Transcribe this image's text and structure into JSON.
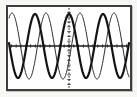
{
  "screen": {
    "background_color": "#f7f7f4",
    "frame_border_color": "#3e3e3e",
    "frame_fill_color": "#ffffff"
  },
  "chart_data": {
    "type": "line",
    "title": "",
    "xlabel": "",
    "ylabel": "",
    "grid": false,
    "legend": "none",
    "axes": {
      "axis_color": "#1c1c1c",
      "x_axis_y_px": 46,
      "y_axis_x_px": 69,
      "y_axis_style": "dashed-with-ticks",
      "x_axis_style": "solid-with-ticks",
      "tick_spacing_px": 4.8,
      "tick_half_len_px": 1.7,
      "plot": {
        "x0": 9,
        "x1": 129,
        "y0": 8,
        "y1": 88
      }
    },
    "series": [
      {
        "name": "thin-sine",
        "shape": "cosine",
        "amplitude_px": 33,
        "period_px": 34,
        "peak_x_px": 46,
        "stroke_width": 1,
        "color": "#2e2e2e",
        "peaks_x_px": [
          12,
          46,
          80,
          114
        ]
      },
      {
        "name": "bold-sine",
        "shape": "cosine",
        "amplitude_px": 32,
        "period_px": 34,
        "peak_x_px": 35,
        "stroke_width": 2.2,
        "color": "#141414",
        "peaks_x_px": [
          35,
          69,
          103
        ]
      }
    ]
  }
}
